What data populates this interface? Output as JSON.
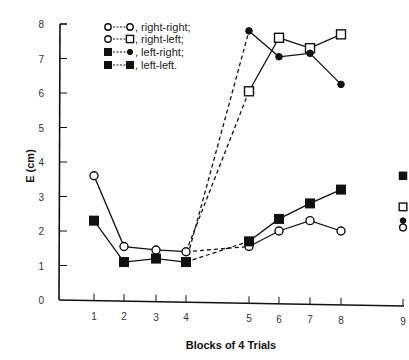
{
  "chart_data": {
    "type": "line",
    "title": "",
    "xlabel": "Blocks of 4 Trials",
    "ylabel": "E (cm)",
    "x": [
      1,
      2,
      3,
      4,
      5,
      6,
      7,
      8,
      9
    ],
    "xticks": [
      "1",
      "2",
      "3",
      "4",
      "5",
      "6",
      "7",
      "8",
      "9"
    ],
    "yticks": [
      "0",
      "1",
      "2",
      "3",
      "4",
      "5",
      "6",
      "7",
      "8"
    ],
    "ylim": [
      0,
      8
    ],
    "xlim": [
      0,
      9
    ],
    "grid": false,
    "legend_position": "upper-left-inside",
    "legend": [
      {
        "label": "right-right;",
        "first_marker": "open-circle",
        "second_marker": "open-circle"
      },
      {
        "label": "right-left;",
        "first_marker": "open-circle",
        "second_marker": "open-square"
      },
      {
        "label": "left-right;",
        "first_marker": "filled-square",
        "second_marker": "filled-circle"
      },
      {
        "label": "left-left.",
        "first_marker": "filled-square",
        "second_marker": "filled-square"
      }
    ],
    "series": [
      {
        "name": "right-right",
        "phase1": {
          "x": [
            1,
            2,
            3,
            4
          ],
          "values": [
            3.6,
            1.55,
            1.45,
            1.4
          ],
          "marker": "open-circle"
        },
        "phase2": {
          "x": [
            5,
            6,
            7,
            8
          ],
          "values": [
            1.55,
            2.0,
            2.3,
            2.0
          ],
          "marker": "open-circle"
        },
        "retention": {
          "x": 9,
          "value": 2.1,
          "marker": "open-circle"
        }
      },
      {
        "name": "right-left",
        "phase1": {
          "x": [
            1,
            2,
            3,
            4
          ],
          "values": [
            3.6,
            1.55,
            1.45,
            1.4
          ],
          "marker": "open-circle"
        },
        "phase2": {
          "x": [
            5,
            6,
            7,
            8
          ],
          "values": [
            6.05,
            7.6,
            7.3,
            7.7
          ],
          "marker": "open-square"
        },
        "retention": {
          "x": 9,
          "value": 2.7,
          "marker": "open-square"
        }
      },
      {
        "name": "left-right",
        "phase1": {
          "x": [
            1,
            2,
            3,
            4
          ],
          "values": [
            2.3,
            1.1,
            1.2,
            1.1
          ],
          "marker": "filled-square"
        },
        "phase2": {
          "x": [
            5,
            6,
            7,
            8
          ],
          "values": [
            7.8,
            7.05,
            7.15,
            6.25
          ],
          "marker": "filled-circle"
        },
        "retention": {
          "x": 9,
          "value": 2.3,
          "marker": "filled-circle"
        }
      },
      {
        "name": "left-left",
        "phase1": {
          "x": [
            1,
            2,
            3,
            4
          ],
          "values": [
            2.3,
            1.1,
            1.2,
            1.1
          ],
          "marker": "filled-square"
        },
        "phase2": {
          "x": [
            5,
            6,
            7,
            8
          ],
          "values": [
            1.7,
            2.35,
            2.8,
            3.2
          ],
          "marker": "filled-square"
        },
        "retention": {
          "x": 9,
          "value": 3.6,
          "marker": "filled-square"
        }
      }
    ],
    "annotations": "Dashed lines connect block 4 to block 5 for each condition (transfer); block 9 shows isolated retention markers."
  },
  "colors": {
    "ink": "#111111",
    "background": "#ffffff"
  }
}
